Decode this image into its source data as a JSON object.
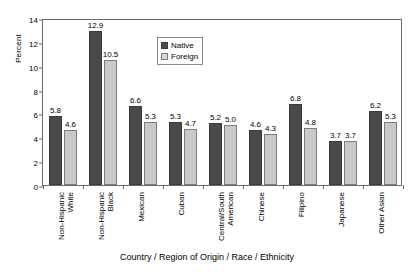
{
  "chart_data": {
    "type": "bar",
    "title": "",
    "xlabel": "Country / Region of Origin / Race / Ethnicity",
    "ylabel": "Percent",
    "ylim": [
      0,
      14
    ],
    "yticks": [
      "0",
      "2",
      "4",
      "6",
      "8",
      "10",
      "12",
      "14"
    ],
    "grid": false,
    "legend_position": "top-center",
    "categories": [
      "Non-Hispanic White",
      "Non-Hispanic Black",
      "Mexican",
      "Cuban",
      "Central/South American",
      "Chinese",
      "Filipino",
      "Japanese",
      "Other Asian"
    ],
    "category_lines": [
      [
        "Non-Hispanic",
        "White"
      ],
      [
        "Non-Hispanic",
        "Black"
      ],
      [
        "Mexican",
        ""
      ],
      [
        "Cuban",
        ""
      ],
      [
        "Central/South",
        "American"
      ],
      [
        "Chinese",
        ""
      ],
      [
        "Filipino",
        ""
      ],
      [
        "Japanese",
        ""
      ],
      [
        "Other Asian",
        ""
      ]
    ],
    "series": [
      {
        "name": "Native",
        "color": "#4a4a4a",
        "values": [
          5.8,
          12.9,
          6.6,
          5.3,
          5.2,
          4.6,
          6.8,
          3.7,
          6.2
        ],
        "labels": [
          "5.8",
          "12.9",
          "6.6",
          "5.3",
          "5.2",
          "4.6",
          "6.8",
          "3.7",
          "6.2"
        ]
      },
      {
        "name": "Foreign",
        "color": "#c9c9c9",
        "values": [
          4.6,
          10.5,
          5.3,
          4.7,
          5.0,
          4.3,
          4.8,
          3.7,
          5.3
        ],
        "labels": [
          "4.6",
          "10.5",
          "5.3",
          "4.7",
          "5.0",
          "4.3",
          "4.8",
          "3.7",
          "5.3"
        ]
      }
    ]
  },
  "legend": {
    "items": [
      {
        "label": "Native"
      },
      {
        "label": "Foreign"
      }
    ]
  }
}
